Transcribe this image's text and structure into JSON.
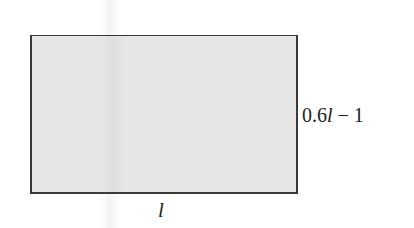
{
  "diagram": {
    "shape": "rectangle",
    "fill_color": "#e6e6e6",
    "stroke_color": "#3a3a3a",
    "side_labels": {
      "right": {
        "prefix": "0.6",
        "variable": "l",
        "suffix": " − 1"
      },
      "bottom": {
        "variable": "l"
      }
    }
  }
}
